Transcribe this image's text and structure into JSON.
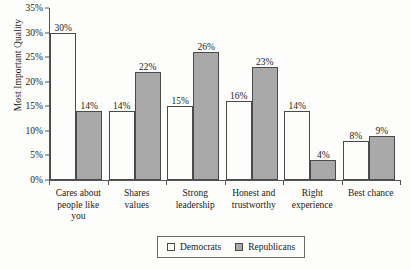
{
  "chart_data": {
    "type": "bar",
    "title": "",
    "xlabel": "",
    "ylabel": "Most Important Quality",
    "ylim": [
      0,
      35
    ],
    "ytick_labels": [
      "0%",
      "5%",
      "10%",
      "15%",
      "20%",
      "25%",
      "30%",
      "35%"
    ],
    "ytick_values": [
      0,
      5,
      10,
      15,
      20,
      25,
      30,
      35
    ],
    "grid": false,
    "legend_position": "bottom",
    "categories": [
      "Cares about people like you",
      "Shares values",
      "Strong leadership",
      "Honest and trustworthy",
      "Right experience",
      "Best chance"
    ],
    "category_lines": [
      [
        "Cares about",
        "people like",
        "you"
      ],
      [
        "Shares",
        "values"
      ],
      [
        "Strong",
        "leadership"
      ],
      [
        "Honest and",
        "trustworthy"
      ],
      [
        "Right",
        "experience"
      ],
      [
        "Best chance"
      ]
    ],
    "series": [
      {
        "name": "Democrats",
        "color": "#fdfdfc",
        "values": [
          30,
          14,
          15,
          16,
          14,
          8
        ],
        "labels": [
          "30%",
          "14%",
          "15%",
          "16%",
          "14%",
          "8%"
        ]
      },
      {
        "name": "Republicans",
        "color": "#a9a9a9",
        "values": [
          14,
          22,
          26,
          23,
          4,
          9
        ],
        "labels": [
          "14%",
          "22%",
          "26%",
          "23%",
          "4%",
          "9%"
        ]
      }
    ]
  },
  "legend": {
    "entries": [
      {
        "label": "Democrats",
        "swatch": "dem"
      },
      {
        "label": "Republicans",
        "swatch": "rep"
      }
    ]
  }
}
